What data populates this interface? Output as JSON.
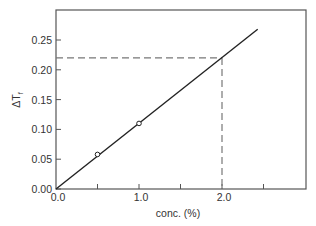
{
  "chart_data": {
    "type": "line",
    "title": "",
    "xlabel": "conc. (%)",
    "ylabel": "ΔTf",
    "ylabel_main": "ΔT",
    "ylabel_sub": "f",
    "xlim": [
      0.0,
      3.0
    ],
    "ylim": [
      0.0,
      0.3
    ],
    "x_ticks": [
      0.0,
      0.5,
      1.0,
      1.5,
      2.0,
      2.5
    ],
    "x_tick_labels": [
      "0.0",
      "",
      "1.0",
      "",
      "2.0",
      ""
    ],
    "y_ticks": [
      0.0,
      0.05,
      0.1,
      0.15,
      0.2,
      0.25
    ],
    "y_tick_labels": [
      "0.00",
      "0.05",
      "0.10",
      "0.15",
      "0.20",
      "0.25"
    ],
    "grid": false,
    "legend": null,
    "series": [
      {
        "name": "fit line",
        "style": "solid",
        "x": [
          0.0,
          2.43
        ],
        "y": [
          0.0,
          0.268
        ]
      },
      {
        "name": "measured points",
        "style": "open-circle-markers",
        "x": [
          0.5,
          1.0
        ],
        "y": [
          0.058,
          0.11
        ]
      }
    ],
    "annotations": [
      {
        "type": "dashed-hline",
        "y": 0.22,
        "x_from": 0.0,
        "x_to": 2.0
      },
      {
        "type": "dashed-vline",
        "x": 2.0,
        "y_from": 0.0,
        "y_to": 0.22
      }
    ]
  }
}
